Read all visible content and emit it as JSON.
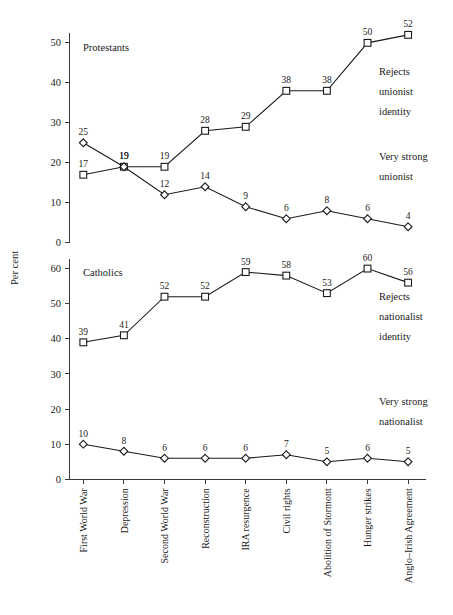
{
  "chart_data": {
    "type": "line",
    "title": "",
    "ylabel": "Per cent",
    "xlabel": "",
    "grid": false,
    "legend": "inline-annotations",
    "categories": [
      "First World War",
      "Depression",
      "Second World War",
      "Reconstruction",
      "IRA resurgence",
      "Civil rights",
      "Abolition of Stormont",
      "Hunger strikes",
      "Anglo–Irish Agreement"
    ],
    "panels": [
      {
        "name": "Protestants",
        "ylim": [
          0,
          55
        ],
        "yticks": [
          0,
          10,
          20,
          30,
          40,
          50
        ],
        "series": [
          {
            "name": "Rejects unionist identity",
            "marker": "square",
            "values": [
              17,
              19,
              19,
              28,
              29,
              38,
              38,
              50,
              52
            ],
            "annotation": [
              "Rejects",
              "unionist",
              "identity"
            ]
          },
          {
            "name": "Very strong unionist",
            "marker": "diamond",
            "values": [
              25,
              19,
              12,
              14,
              9,
              6,
              8,
              6,
              4
            ],
            "annotation": [
              "Very strong",
              "unionist"
            ]
          }
        ]
      },
      {
        "name": "Catholics",
        "ylim": [
          0,
          65
        ],
        "yticks": [
          0,
          10,
          20,
          30,
          40,
          50,
          60
        ],
        "series": [
          {
            "name": "Rejects nationalist identity",
            "marker": "square",
            "values": [
              39,
              41,
              52,
              52,
              59,
              58,
              53,
              60,
              56
            ],
            "annotation": [
              "Rejects",
              "nationalist",
              "identity"
            ]
          },
          {
            "name": "Very strong nationalist",
            "marker": "diamond",
            "values": [
              10,
              8,
              6,
              6,
              6,
              7,
              5,
              6,
              5
            ],
            "annotation": [
              "Very strong",
              "nationalist"
            ]
          }
        ]
      }
    ],
    "colors": {
      "line": "#1a1a1a",
      "marker_fill": "#ffffff",
      "axis": "#3a3a3a",
      "text": "#1a1a1a",
      "background": "#ffffff"
    }
  },
  "labels": {
    "ylabel": "Per cent",
    "panel_top": "Protestants",
    "panel_bottom": "Catholics",
    "annot_top_a": [
      "Rejects",
      "unionist",
      "identity"
    ],
    "annot_top_b": [
      "Very strong",
      "unionist"
    ],
    "annot_bottom_a": [
      "Rejects",
      "nationalist",
      "identity"
    ],
    "annot_bottom_b": [
      "Very strong",
      "nationalist"
    ]
  }
}
